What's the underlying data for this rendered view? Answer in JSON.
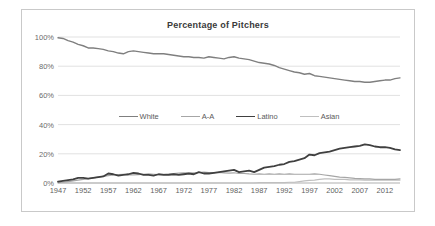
{
  "chart": {
    "title": "Percentage of Pitchers",
    "frame_border_color": "#c9c9c9",
    "grid_color": "#d4d4d4",
    "axis_color": "#a6a6a6"
  },
  "legend": {
    "position": "inside-upper-middle",
    "entries": [
      {
        "label": "White",
        "color": "#7f7f7f",
        "width": 1.4
      },
      {
        "label": "A-A",
        "color": "#a6a6a6",
        "width": 1.2
      },
      {
        "label": "Latino",
        "color": "#404040",
        "width": 1.8
      },
      {
        "label": "Asian",
        "color": "#bfbfbf",
        "width": 1.2
      }
    ]
  },
  "chart_data": {
    "type": "line",
    "title": "Percentage of Pitchers",
    "xlabel": "",
    "ylabel": "",
    "xlim": [
      1947,
      2015
    ],
    "ylim": [
      0,
      100
    ],
    "grid": true,
    "yticks": [
      "0%",
      "20%",
      "40%",
      "60%",
      "80%",
      "100%"
    ],
    "ytick_values": [
      0,
      20,
      40,
      60,
      80,
      100
    ],
    "xticks": [
      "1947",
      "1952",
      "1957",
      "1962",
      "1967",
      "1972",
      "1977",
      "1982",
      "1987",
      "1992",
      "1997",
      "2002",
      "2007",
      "2012"
    ],
    "xtick_values": [
      1947,
      1952,
      1957,
      1962,
      1967,
      1972,
      1977,
      1982,
      1987,
      1992,
      1997,
      2002,
      2007,
      2012
    ],
    "x": [
      1947,
      1948,
      1949,
      1950,
      1951,
      1952,
      1953,
      1954,
      1955,
      1956,
      1957,
      1958,
      1959,
      1960,
      1961,
      1962,
      1963,
      1964,
      1965,
      1966,
      1967,
      1968,
      1969,
      1970,
      1971,
      1972,
      1973,
      1974,
      1975,
      1976,
      1977,
      1978,
      1979,
      1980,
      1981,
      1982,
      1983,
      1984,
      1985,
      1986,
      1987,
      1988,
      1989,
      1990,
      1991,
      1992,
      1993,
      1994,
      1995,
      1996,
      1997,
      1998,
      1999,
      2000,
      2001,
      2002,
      2003,
      2004,
      2005,
      2006,
      2007,
      2008,
      2009,
      2010,
      2011,
      2012,
      2013,
      2014,
      2015
    ],
    "series": [
      {
        "name": "White",
        "color": "#7f7f7f",
        "values": [
          99.5,
          99.0,
          97.5,
          96.5,
          95.0,
          94.0,
          92.5,
          92.5,
          92.0,
          91.5,
          90.5,
          90.0,
          89.0,
          88.5,
          90.0,
          90.5,
          90.0,
          89.5,
          89.0,
          88.5,
          88.5,
          88.5,
          88.0,
          87.5,
          87.0,
          86.5,
          86.5,
          86.0,
          86.0,
          85.5,
          86.5,
          86.0,
          85.5,
          85.0,
          86.0,
          86.5,
          85.5,
          85.0,
          84.5,
          83.5,
          82.5,
          82.0,
          81.5,
          80.5,
          79.0,
          78.0,
          77.0,
          76.0,
          75.5,
          74.5,
          75.0,
          73.5,
          73.0,
          72.5,
          72.0,
          71.5,
          71.0,
          70.5,
          70.0,
          69.5,
          69.5,
          69.0,
          69.0,
          69.5,
          70.0,
          70.5,
          70.5,
          71.5,
          72.0
        ]
      },
      {
        "name": "A-A",
        "color": "#a6a6a6",
        "values": [
          0.3,
          0.5,
          1.0,
          1.5,
          2.0,
          2.5,
          3.0,
          3.5,
          4.0,
          4.5,
          5.0,
          5.5,
          5.8,
          6.0,
          5.5,
          5.5,
          5.8,
          6.0,
          6.2,
          6.0,
          5.8,
          6.0,
          6.2,
          6.5,
          6.8,
          7.0,
          6.8,
          7.0,
          7.2,
          7.5,
          7.2,
          7.0,
          7.2,
          7.0,
          6.8,
          7.0,
          6.5,
          6.5,
          6.2,
          6.0,
          6.2,
          6.0,
          6.2,
          6.0,
          6.2,
          6.0,
          6.2,
          6.0,
          6.0,
          6.0,
          6.0,
          6.2,
          6.0,
          5.5,
          5.0,
          4.5,
          4.0,
          3.8,
          3.5,
          3.2,
          3.0,
          2.8,
          2.8,
          2.5,
          2.5,
          2.5,
          2.5,
          2.5,
          2.8
        ]
      },
      {
        "name": "Latino",
        "color": "#404040",
        "values": [
          1.0,
          1.5,
          2.0,
          2.5,
          3.5,
          3.5,
          3.0,
          3.5,
          4.0,
          4.5,
          6.5,
          6.0,
          5.0,
          5.5,
          6.0,
          7.0,
          6.5,
          5.5,
          5.5,
          5.0,
          6.0,
          5.5,
          5.5,
          6.0,
          5.5,
          6.0,
          6.5,
          6.0,
          7.5,
          6.5,
          6.5,
          7.0,
          7.5,
          8.0,
          8.5,
          9.0,
          7.5,
          8.0,
          8.5,
          7.5,
          9.0,
          10.5,
          11.0,
          11.5,
          12.5,
          13.0,
          14.5,
          15.0,
          16.0,
          17.0,
          19.5,
          19.0,
          20.5,
          21.0,
          21.5,
          22.5,
          23.5,
          24.0,
          24.5,
          25.0,
          25.5,
          26.5,
          26.0,
          25.0,
          24.5,
          24.5,
          24.0,
          23.0,
          22.5
        ]
      },
      {
        "name": "Asian",
        "color": "#bfbfbf",
        "values": [
          0.0,
          0.0,
          0.0,
          0.0,
          0.0,
          0.0,
          0.0,
          0.0,
          0.0,
          0.0,
          0.0,
          0.0,
          0.0,
          0.0,
          0.0,
          0.0,
          0.0,
          0.0,
          0.0,
          0.0,
          0.0,
          0.0,
          0.0,
          0.0,
          0.0,
          0.0,
          0.0,
          0.0,
          0.0,
          0.0,
          0.0,
          0.0,
          0.0,
          0.0,
          0.0,
          0.0,
          0.0,
          0.0,
          0.0,
          0.0,
          0.2,
          0.2,
          0.2,
          0.3,
          0.3,
          0.3,
          0.5,
          0.5,
          1.0,
          1.5,
          1.8,
          2.0,
          2.5,
          2.8,
          2.8,
          2.5,
          2.5,
          2.5,
          2.2,
          2.2,
          2.2,
          2.0,
          2.0,
          2.0,
          2.0,
          2.0,
          2.0,
          2.0,
          2.0
        ]
      }
    ]
  }
}
